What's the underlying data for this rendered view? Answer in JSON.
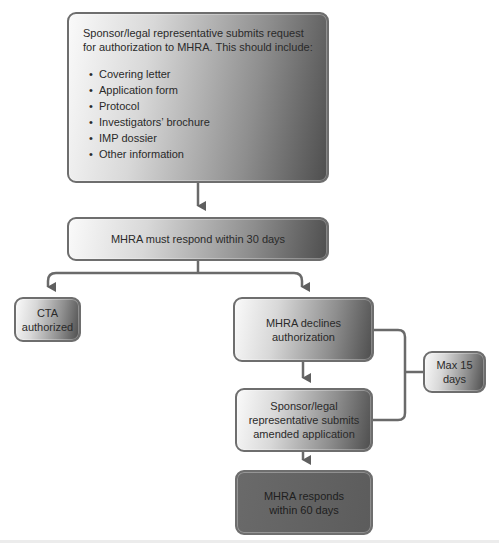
{
  "diagram": {
    "request": {
      "intro": "Sponsor/legal representative submits request for authorization to MHRA. This should include:",
      "items": [
        "Covering letter",
        "Application form",
        "Protocol",
        "Investigators’ brochure",
        "IMP dossier",
        "Other information"
      ]
    },
    "respond_30": "MHRA must respond within 30 days",
    "cta_authorized": "CTA authorized",
    "declines": "MHRA declines authorization",
    "max_15": "Max 15 days",
    "amended": "Sponsor/legal representative submits amended application",
    "respond_60": "MHRA responds within 60 days",
    "colors": {
      "border": "#6e6e6e",
      "connector": "#6a6a6a",
      "dark_box": "#5e5e5e",
      "gradient_light": "#fafafa",
      "gradient_dark": "#4e4e4e"
    }
  }
}
